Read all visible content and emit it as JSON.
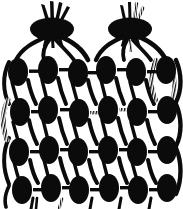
{
  "artwork": {
    "title": "Stylized botanical braid illustration",
    "style": "black-and-white woodcut / stencil line art",
    "canvas": {
      "width": 183,
      "height": 209
    },
    "colors": {
      "ink": "#0b0b0b",
      "background": "#ffffff"
    },
    "description": "Two onion-like bulbs at the top with tufted shoots, whose stems fan downward into a lattice of oval seed shapes arranged in four rows of six."
  },
  "bulbs": [
    {
      "name": "left-bulb",
      "center_x": 52,
      "center_y": 28,
      "radius_x": 21,
      "radius_y": 11,
      "tuft_count": 4,
      "tuft_style": "solid",
      "stem_count": 4
    },
    {
      "name": "right-bulb",
      "center_x": 130,
      "center_y": 28,
      "radius_x": 21,
      "radius_y": 11,
      "tuft_count": 4,
      "tuft_style": "hatched",
      "stem_count": 4
    }
  ],
  "lattice": {
    "rows": 4,
    "columns": 6,
    "row_centers_y": [
      72,
      110,
      150,
      188
    ],
    "column_centers_x": [
      18,
      48,
      78,
      106,
      136,
      166
    ],
    "seed": {
      "radius_x": 10,
      "radius_y": 14,
      "shape": "ellipse",
      "fill": "#0b0b0b"
    },
    "connector": {
      "style": "short horizontal bar",
      "thickness": 3
    }
  },
  "seed_grid": [
    [
      {
        "cx": 18,
        "cy": 72,
        "rx": 10,
        "ry": 14
      },
      {
        "cx": 48,
        "cy": 70,
        "rx": 10,
        "ry": 14
      },
      {
        "cx": 78,
        "cy": 73,
        "rx": 10,
        "ry": 14
      },
      {
        "cx": 106,
        "cy": 70,
        "rx": 10,
        "ry": 14
      },
      {
        "cx": 136,
        "cy": 72,
        "rx": 10,
        "ry": 14
      },
      {
        "cx": 166,
        "cy": 70,
        "rx": 10,
        "ry": 14
      }
    ],
    [
      {
        "cx": 20,
        "cy": 112,
        "rx": 10,
        "ry": 14
      },
      {
        "cx": 48,
        "cy": 110,
        "rx": 10,
        "ry": 14
      },
      {
        "cx": 79,
        "cy": 113,
        "rx": 10,
        "ry": 14
      },
      {
        "cx": 108,
        "cy": 110,
        "rx": 10,
        "ry": 14
      },
      {
        "cx": 137,
        "cy": 112,
        "rx": 10,
        "ry": 14
      },
      {
        "cx": 167,
        "cy": 110,
        "rx": 10,
        "ry": 14
      }
    ],
    [
      {
        "cx": 19,
        "cy": 152,
        "rx": 10,
        "ry": 14
      },
      {
        "cx": 49,
        "cy": 150,
        "rx": 10,
        "ry": 14
      },
      {
        "cx": 78,
        "cy": 152,
        "rx": 10,
        "ry": 14
      },
      {
        "cx": 108,
        "cy": 150,
        "rx": 10,
        "ry": 14
      },
      {
        "cx": 137,
        "cy": 152,
        "rx": 10,
        "ry": 14
      },
      {
        "cx": 167,
        "cy": 150,
        "rx": 10,
        "ry": 14
      }
    ],
    [
      {
        "cx": 22,
        "cy": 190,
        "rx": 10,
        "ry": 14
      },
      {
        "cx": 51,
        "cy": 188,
        "rx": 10,
        "ry": 14
      },
      {
        "cx": 79,
        "cy": 190,
        "rx": 10,
        "ry": 14
      },
      {
        "cx": 109,
        "cy": 188,
        "rx": 10,
        "ry": 14
      },
      {
        "cx": 138,
        "cy": 190,
        "rx": 10,
        "ry": 14
      },
      {
        "cx": 167,
        "cy": 188,
        "rx": 10,
        "ry": 14
      }
    ]
  ],
  "caption": {
    "text": ""
  }
}
